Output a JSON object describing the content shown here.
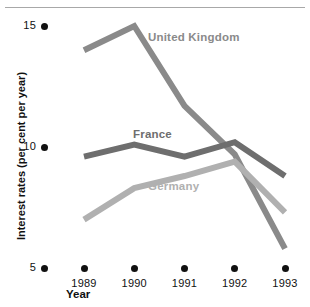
{
  "chart_data": {
    "type": "line",
    "title": "",
    "xlabel": "Year",
    "ylabel": "Interest rates (per cent per year)",
    "categories": [
      "1989",
      "1990",
      "1991",
      "1992",
      "1993"
    ],
    "x": [
      1989,
      1990,
      1991,
      1992,
      1993
    ],
    "xlim": [
      1988.6,
      1993.4
    ],
    "ylim": [
      5,
      15
    ],
    "yticks": [
      5,
      10,
      15
    ],
    "ytick_labels": [
      "5",
      "10",
      "15"
    ],
    "grid": false,
    "legend": "inline-labels",
    "series": [
      {
        "name": "United Kingdom",
        "color": "#8a8a8a",
        "values": [
          14.0,
          15.0,
          11.7,
          9.7,
          5.8
        ]
      },
      {
        "name": "France",
        "color": "#6e6e6e",
        "values": [
          9.6,
          10.1,
          9.6,
          10.2,
          8.8
        ]
      },
      {
        "name": "Germany",
        "color": "#b0b0b0",
        "values": [
          7.0,
          8.3,
          8.8,
          9.4,
          7.3
        ]
      }
    ],
    "annotations": [
      {
        "text": "United Kingdom",
        "series": "United Kingdom",
        "color": "#8a8a8a"
      },
      {
        "text": "France",
        "series": "France",
        "color": "#6e6e6e"
      },
      {
        "text": "Germany",
        "series": "Germany",
        "color": "#b0b0b0"
      }
    ]
  },
  "axes": {
    "y_title": "Interest rates (per cent per year)",
    "x_title": "Year",
    "y_ticks": [
      {
        "label": "15",
        "value": 15
      },
      {
        "label": "10",
        "value": 10
      },
      {
        "label": "5",
        "value": 5
      }
    ],
    "x_ticks": [
      {
        "label": "1989",
        "value": 1989
      },
      {
        "label": "1990",
        "value": 1990
      },
      {
        "label": "1991",
        "value": 1991
      },
      {
        "label": "1992",
        "value": 1992
      },
      {
        "label": "1993",
        "value": 1993
      }
    ]
  },
  "series_labels": {
    "uk": "United Kingdom",
    "france": "France",
    "germany": "Germany"
  },
  "colors": {
    "uk": "#8a8a8a",
    "france": "#6e6e6e",
    "germany": "#b0b0b0",
    "axis_text": "#111111",
    "top_rule": "#a8a8a8",
    "background": "#ffffff"
  }
}
